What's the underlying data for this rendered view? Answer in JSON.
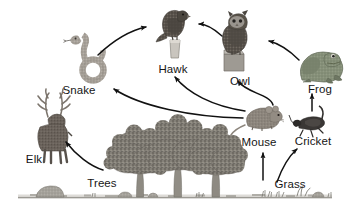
{
  "diagram": {
    "type": "food-web",
    "title": "",
    "background_color": "#ffffff",
    "label_color": "#161616",
    "arrow_color": "#111111",
    "ground_color": "#8e8d86",
    "ground_line": {
      "x1": 18,
      "x2": 332,
      "y": 197
    },
    "organisms": [
      {
        "id": "elk",
        "label": "Elk",
        "label_x": 34,
        "label_y": 163,
        "icon": "elk-icon",
        "x": 28,
        "y": 100,
        "w": 52,
        "h": 55,
        "color": "#6e6660",
        "trophic": "herbivore"
      },
      {
        "id": "snake",
        "label": "Snake",
        "label_x": 79,
        "label_y": 94,
        "icon": "snake-icon",
        "x": 68,
        "y": 40,
        "w": 46,
        "h": 45,
        "color": "#a09a92",
        "trophic": "secondary-consumer"
      },
      {
        "id": "hawk",
        "label": "Hawk",
        "label_x": 173,
        "label_y": 73,
        "icon": "hawk-icon",
        "x": 150,
        "y": 10,
        "w": 46,
        "h": 50,
        "color": "#544f4a",
        "trophic": "tertiary-consumer"
      },
      {
        "id": "owl",
        "label": "Owl",
        "label_x": 240,
        "label_y": 85,
        "icon": "owl-icon",
        "x": 218,
        "y": 26,
        "w": 45,
        "h": 50,
        "color": "#5c5750",
        "trophic": "tertiary-consumer"
      },
      {
        "id": "frog",
        "label": "Frog",
        "label_x": 320,
        "label_y": 93,
        "icon": "frog-icon",
        "x": 296,
        "y": 46,
        "w": 48,
        "h": 40,
        "color": "#7e8874",
        "trophic": "secondary-consumer"
      },
      {
        "id": "mouse",
        "label": "Mouse",
        "label_x": 259,
        "label_y": 146,
        "icon": "mouse-icon",
        "x": 240,
        "y": 108,
        "w": 44,
        "h": 30,
        "color": "#8a837b",
        "trophic": "herbivore"
      },
      {
        "id": "cricket",
        "label": "Cricket",
        "label_x": 313,
        "label_y": 145,
        "icon": "cricket-icon",
        "x": 292,
        "y": 112,
        "w": 42,
        "h": 28,
        "color": "#343230",
        "trophic": "herbivore"
      },
      {
        "id": "trees",
        "label": "Trees",
        "label_x": 102,
        "label_y": 187,
        "icon": "trees-icon",
        "x": 108,
        "y": 128,
        "w": 128,
        "h": 70,
        "color": "#7d7a72",
        "trophic": "producer"
      },
      {
        "id": "grass",
        "label": "Grass",
        "label_x": 290,
        "label_y": 188,
        "icon": "grass-icon",
        "x": 262,
        "y": 190,
        "w": 60,
        "h": 8,
        "color": "#8a8a80",
        "trophic": "producer"
      }
    ],
    "arrows": [
      {
        "id": "trees-to-elk",
        "from": "trees",
        "to": "elk",
        "label": "Trees → Elk",
        "path": "M 103 170 C 90 166 76 155 66 142"
      },
      {
        "id": "snake-to-hawk",
        "from": "snake",
        "to": "hawk",
        "label": "Snake → Hawk",
        "path": "M 98 55 C 116 38 132 30 146 27"
      },
      {
        "id": "owl-to-hawk",
        "from": "owl",
        "to": "hawk",
        "label": "Owl → Hawk",
        "path": "M 222 36 C 212 27 205 24 197 24"
      },
      {
        "id": "frog-to-owl",
        "from": "frog",
        "to": "owl",
        "label": "Frog → Owl",
        "path": "M 299 60 C 288 49 277 43 268 41"
      },
      {
        "id": "mouse-to-snake",
        "from": "mouse",
        "to": "snake",
        "label": "Mouse → Snake",
        "path": "M 243 118 C 190 117 140 106 113 88"
      },
      {
        "id": "mouse-to-hawk",
        "from": "mouse",
        "to": "hawk",
        "label": "Mouse → Hawk",
        "path": "M 245 112 C 212 107 187 93 174 76"
      },
      {
        "id": "mouse-to-owl",
        "from": "mouse",
        "to": "owl",
        "label": "Mouse → Owl",
        "path": "M 272 106 C 269 95 245 93 237 80"
      },
      {
        "id": "cricket-to-frog",
        "from": "cricket",
        "to": "frog",
        "label": "Cricket → Frog",
        "path": "M 312 110 L 312 93"
      },
      {
        "id": "grass-to-mouse",
        "from": "grass",
        "to": "mouse",
        "label": "Grass → Mouse",
        "path": "M 263 180 L 263 152"
      },
      {
        "id": "grass-to-cricket",
        "from": "grass",
        "to": "cricket",
        "label": "Grass → Cricket",
        "path": "M 277 182 C 282 168 288 156 297 148"
      }
    ],
    "scenery": [
      {
        "id": "rock-left",
        "label": "rock",
        "x": 36,
        "y": 186,
        "w": 28,
        "h": 11
      },
      {
        "id": "rock-mid-1",
        "label": "rock",
        "x": 118,
        "y": 192,
        "w": 14,
        "h": 5
      },
      {
        "id": "rock-mid-2",
        "label": "rock",
        "x": 148,
        "y": 193,
        "w": 10,
        "h": 4
      },
      {
        "id": "rock-right",
        "label": "rock",
        "x": 312,
        "y": 192,
        "w": 12,
        "h": 5
      }
    ]
  }
}
